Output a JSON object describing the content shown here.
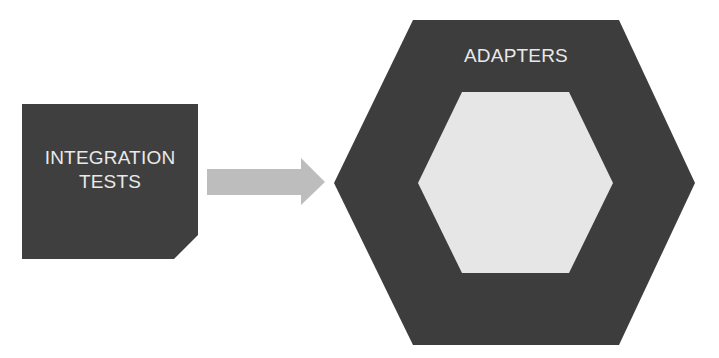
{
  "diagram": {
    "test_box": {
      "label_line1": "INTEGRATION",
      "label_line2": "TESTS",
      "fill": "#3f3f3f"
    },
    "arrow": {
      "direction": "right",
      "fill": "#bdbdbd"
    },
    "outer_hexagon": {
      "label": "ADAPTERS",
      "fill": "#3d3d3d"
    },
    "inner_hexagon": {
      "label": "",
      "fill": "#e6e6e6"
    }
  }
}
